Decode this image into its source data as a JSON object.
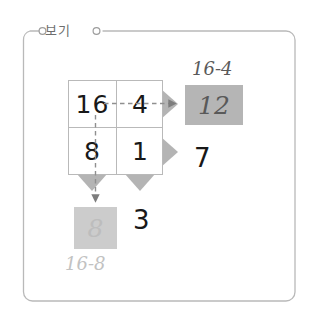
{
  "frame": {
    "label": "보기",
    "border_color": "#b9b9b9",
    "left_circle_icon": "circle-icon",
    "right_circle_icon": "circle-icon"
  },
  "grid": {
    "name": "subtraction-grid",
    "rows": [
      {
        "cells": [
          {
            "value": "16"
          },
          {
            "value": "4"
          }
        ]
      },
      {
        "cells": [
          {
            "value": "8"
          },
          {
            "value": "1"
          }
        ]
      }
    ],
    "border_color": "#b9b9b9"
  },
  "arrows": {
    "triangle_color": "#b4b4b4",
    "dash_color": "#8f8f8f",
    "top_right": "arrow-right-icon",
    "bottom_right": "arrow-right-icon",
    "left_down": "arrow-down-icon",
    "right_down": "arrow-down-icon"
  },
  "results": {
    "top": {
      "expression": "16-4",
      "value": "12",
      "box_color": "#b5b5b5",
      "text_color": "#595959"
    },
    "bottom": {
      "expression": "16-8",
      "value": "8",
      "box_color": "#cccccc",
      "text_color": "#bdbdbd"
    }
  },
  "loose_numbers": {
    "right": "7",
    "bottom": "3"
  }
}
